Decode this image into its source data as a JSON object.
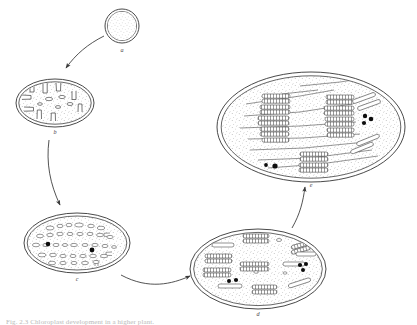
{
  "figure": {
    "caption": "Fig. 2.3  Chloroplast development in a higher plant.",
    "background_color": "#ffffff",
    "line_color": "#3f3f3f",
    "stipple_color": "#8c8c8c",
    "granule_color": "#0d0d0d",
    "label_color": "#4a4a4a"
  },
  "stages": [
    {
      "id": "a",
      "label": "a",
      "name": "proplastid",
      "shape": "circle",
      "cx": 122,
      "cy": 26,
      "r": 17,
      "label_x": 122,
      "label_y": 52,
      "granules": 0,
      "vesicles": 0,
      "grana": 0
    },
    {
      "id": "b",
      "label": "b",
      "name": "proplastid-with-invaginations",
      "shape": "ellipse",
      "cx": 55,
      "cy": 103,
      "rx": 39,
      "ry": 24,
      "label_x": 55,
      "label_y": 134,
      "granules": 0,
      "vesicles": 5,
      "grana": 0,
      "invaginations": 9
    },
    {
      "id": "c",
      "label": "c",
      "name": "prolamellar-vesicle-stage",
      "shape": "ellipse",
      "cx": 77,
      "cy": 243,
      "rx": 53,
      "ry": 30,
      "label_x": 77,
      "label_y": 281,
      "granules": 2,
      "vesicles": 44,
      "grana": 0
    },
    {
      "id": "d",
      "label": "d",
      "name": "early-granal-stage",
      "shape": "ellipse",
      "cx": 258,
      "cy": 269,
      "rx": 68,
      "ry": 40,
      "label_x": 258,
      "label_y": 316,
      "granules": 5,
      "vesicles": 3,
      "grana": 14
    },
    {
      "id": "e",
      "label": "e",
      "name": "mature-chloroplast",
      "shape": "ellipse",
      "cx": 311,
      "cy": 127,
      "rx": 94,
      "ry": 55,
      "label_x": 311,
      "label_y": 187,
      "granules": 5,
      "vesicles": 0,
      "grana": 12,
      "stroma_lamellae": 9
    }
  ],
  "arrows": [
    {
      "id": "a-to-b",
      "from": "a",
      "to": "b",
      "label": ""
    },
    {
      "id": "b-to-c",
      "from": "b",
      "to": "c",
      "label": ""
    },
    {
      "id": "c-to-d",
      "from": "c",
      "to": "d",
      "label": ""
    },
    {
      "id": "d-to-e",
      "from": "d",
      "to": "e",
      "label": ""
    }
  ]
}
